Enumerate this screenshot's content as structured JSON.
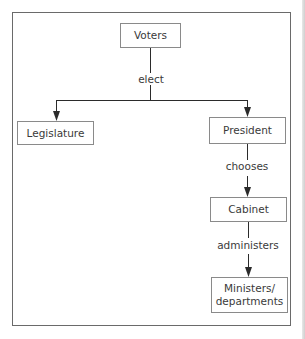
{
  "diagram": {
    "type": "flowchart",
    "nodes": {
      "voters": "Voters",
      "legislature": "Legislature",
      "president": "President",
      "cabinet": "Cabinet",
      "ministers_line1": "Ministers/",
      "ministers_line2": "departments"
    },
    "edges": {
      "elect": "elect",
      "chooses": "chooses",
      "administers": "administers"
    },
    "relations": [
      {
        "from": "Voters",
        "to": "Legislature",
        "label": "elect"
      },
      {
        "from": "Voters",
        "to": "President",
        "label": "elect"
      },
      {
        "from": "President",
        "to": "Cabinet",
        "label": "chooses"
      },
      {
        "from": "Cabinet",
        "to": "Ministers/departments",
        "label": "administers"
      }
    ],
    "colors": {
      "line": "#2b2b2b",
      "box_border": "#8a8a8a",
      "text": "#3a3a3a"
    }
  }
}
